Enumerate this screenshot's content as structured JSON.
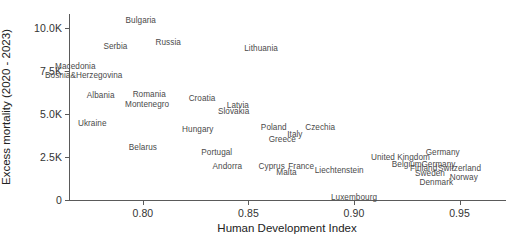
{
  "chart_data": {
    "type": "scatter",
    "title": "",
    "xlabel": "Human Development Index",
    "ylabel": "Excess mortality (2020 - 2023)",
    "xlim": [
      0.765,
      0.972
    ],
    "ylim": [
      0,
      10800
    ],
    "grid": false,
    "legend": false,
    "marker_style": "text-labels-only",
    "xticks": [
      "0.80",
      "0.85",
      "0.90",
      "0.95"
    ],
    "xtick_values": [
      0.8,
      0.85,
      0.9,
      0.95
    ],
    "yticks": [
      "0",
      "2.5K",
      "5.0K",
      "7.5K",
      "10.0K"
    ],
    "ytick_values": [
      0,
      2500,
      5000,
      7500,
      10000
    ],
    "points": [
      {
        "label": "Bulgaria",
        "x": 0.799,
        "y": 10450
      },
      {
        "label": "Serbia",
        "x": 0.787,
        "y": 8950
      },
      {
        "label": "Russia",
        "x": 0.812,
        "y": 9150
      },
      {
        "label": "Lithuania",
        "x": 0.856,
        "y": 8800
      },
      {
        "label": "Macedonia",
        "x": 0.768,
        "y": 7800
      },
      {
        "label": "Bosnia&Herzegovina",
        "x": 0.772,
        "y": 7250
      },
      {
        "label": "Albania",
        "x": 0.78,
        "y": 6100
      },
      {
        "label": "Romania",
        "x": 0.803,
        "y": 6150
      },
      {
        "label": "Montenegro",
        "x": 0.802,
        "y": 5600
      },
      {
        "label": "Croatia",
        "x": 0.828,
        "y": 5900
      },
      {
        "label": "Latvia",
        "x": 0.845,
        "y": 5500
      },
      {
        "label": "Slovakia",
        "x": 0.843,
        "y": 5150
      },
      {
        "label": "Ukraine",
        "x": 0.776,
        "y": 4450
      },
      {
        "label": "Hungary",
        "x": 0.826,
        "y": 4150
      },
      {
        "label": "Poland",
        "x": 0.862,
        "y": 4250
      },
      {
        "label": "Czechia",
        "x": 0.884,
        "y": 4250
      },
      {
        "label": "Italy",
        "x": 0.872,
        "y": 3850
      },
      {
        "label": "Greece",
        "x": 0.866,
        "y": 3550
      },
      {
        "label": "Belarus",
        "x": 0.8,
        "y": 3100
      },
      {
        "label": "Portugal",
        "x": 0.835,
        "y": 2800
      },
      {
        "label": "Andorra",
        "x": 0.84,
        "y": 1950
      },
      {
        "label": "Cyprus",
        "x": 0.861,
        "y": 1950
      },
      {
        "label": "France",
        "x": 0.875,
        "y": 2000
      },
      {
        "label": "Malta",
        "x": 0.868,
        "y": 1600
      },
      {
        "label": "Liechtenstein",
        "x": 0.893,
        "y": 1750
      },
      {
        "label": "United Kingdom",
        "x": 0.922,
        "y": 2500
      },
      {
        "label": "Germany",
        "x": 0.942,
        "y": 2800
      },
      {
        "label": "Belgium",
        "x": 0.925,
        "y": 2100
      },
      {
        "label": "Germany",
        "x": 0.94,
        "y": 2100
      },
      {
        "label": "Finland",
        "x": 0.933,
        "y": 1850
      },
      {
        "label": "Switzerland",
        "x": 0.95,
        "y": 1850
      },
      {
        "label": "Sweden",
        "x": 0.936,
        "y": 1550
      },
      {
        "label": "Norway",
        "x": 0.952,
        "y": 1350
      },
      {
        "label": "Denmark",
        "x": 0.939,
        "y": 1050
      },
      {
        "label": "Luxembourg",
        "x": 0.9,
        "y": 150
      }
    ]
  }
}
